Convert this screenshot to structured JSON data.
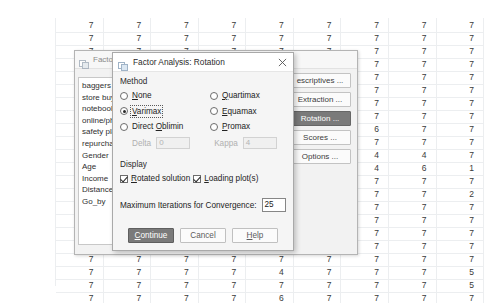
{
  "spreadsheet": {
    "columns": 9,
    "rows": [
      [
        "7",
        "7",
        "7",
        "7",
        "7",
        "7",
        "7",
        "7",
        "7"
      ],
      [
        "7",
        "7",
        "7",
        "7",
        "7",
        "7",
        "7",
        "7",
        "7"
      ],
      [
        "7",
        "7",
        "7",
        "7",
        "7",
        "7",
        "7",
        "7",
        "7"
      ],
      [
        "7",
        "7",
        "7",
        "7",
        "7",
        "7",
        "7",
        "7",
        "7"
      ],
      [
        "7",
        "7",
        "7",
        "7",
        "7",
        "7",
        "7",
        "7",
        "7"
      ],
      [
        "7",
        "7",
        "7",
        "7",
        "7",
        "7",
        "7",
        "7",
        "7"
      ],
      [
        "7",
        "7",
        "7",
        "7",
        "7",
        "7",
        "7",
        "7",
        "7"
      ],
      [
        "7",
        "7",
        "7",
        "7",
        "7",
        "7",
        "7",
        "7",
        "7"
      ],
      [
        "7",
        "7",
        "7",
        "7",
        "7",
        "7",
        "6",
        "7",
        "7"
      ],
      [
        "7",
        "7",
        "7",
        "7",
        "7",
        "7",
        "7",
        "7",
        "7"
      ],
      [
        "7",
        "7",
        "7",
        "7",
        "7",
        "7",
        "4",
        "4",
        "7"
      ],
      [
        "7",
        "7",
        "7",
        "7",
        "7",
        "7",
        "4",
        "6",
        "1"
      ],
      [
        "7",
        "7",
        "7",
        "7",
        "7",
        "7",
        "7",
        "7",
        "7"
      ],
      [
        "7",
        "7",
        "7",
        "7",
        "7",
        "7",
        "7",
        "7",
        "2"
      ],
      [
        "7",
        "7",
        "7",
        "7",
        "7",
        "7",
        "7",
        "7",
        "7"
      ],
      [
        "7",
        "7",
        "7",
        "7",
        "7",
        "7",
        "7",
        "7",
        "7"
      ],
      [
        "7",
        "7",
        "7",
        "7",
        "7",
        "7",
        "7",
        "7",
        "7"
      ],
      [
        "7",
        "7",
        "7",
        "7",
        "7",
        "7",
        "7",
        "7",
        "7"
      ],
      [
        "7",
        "7",
        "7",
        "7",
        "7",
        "7",
        "7",
        "7",
        "7"
      ],
      [
        "7",
        "7",
        "7",
        "7",
        "4",
        "7",
        "7",
        "7",
        "5"
      ],
      [
        "7",
        "7",
        "7",
        "7",
        "7",
        "7",
        "7",
        "7",
        "5"
      ],
      [
        "7",
        "7",
        "7",
        "7",
        "6",
        "7",
        "7",
        "7",
        "7"
      ]
    ]
  },
  "background_dialog": {
    "title": "Factor Analysis",
    "title_clipped": "Factor Anal",
    "icon": "spss-dialog-icon",
    "variables": [
      "baggers [",
      "store buy",
      "notebook",
      "online/ph",
      "safety pla",
      "repurchas",
      "Gender",
      "Age",
      "Income",
      "Distance",
      "Go_by"
    ],
    "side_buttons": [
      {
        "label": "escriptives ...",
        "active": false
      },
      {
        "label": "Extraction ...",
        "active": false
      },
      {
        "label": "Rotation ...",
        "active": true
      },
      {
        "label": "Scores ...",
        "active": false
      },
      {
        "label": "Options ...",
        "active": false
      }
    ],
    "active_button_color": "#7a7a7a"
  },
  "rotation_dialog": {
    "title": "Factor Analysis: Rotation",
    "icon": "spss-dialog-icon",
    "close_icon": "close-icon",
    "method": {
      "group_label": "Method",
      "options": [
        {
          "label": "None",
          "mnemonic": "N",
          "selected": false,
          "focused": false,
          "column": "left"
        },
        {
          "label": "Varimax",
          "mnemonic": "V",
          "selected": true,
          "focused": true,
          "column": "left"
        },
        {
          "label": "Direct Oblimin",
          "mnemonic": "O",
          "selected": false,
          "focused": false,
          "column": "left"
        },
        {
          "label": "Quartimax",
          "mnemonic": "Q",
          "selected": false,
          "focused": false,
          "column": "right"
        },
        {
          "label": "Equamax",
          "mnemonic": "E",
          "selected": false,
          "focused": false,
          "column": "right"
        },
        {
          "label": "Promax",
          "mnemonic": "P",
          "selected": false,
          "focused": false,
          "column": "right"
        }
      ]
    },
    "parameters": [
      {
        "label": "Delta",
        "value": "0",
        "enabled": false
      },
      {
        "label": "Kappa",
        "value": "4",
        "enabled": false
      }
    ],
    "display": {
      "group_label": "Display",
      "checkboxes": [
        {
          "label": "Rotated solution",
          "mnemonic": "R",
          "checked": true
        },
        {
          "label": "Loading plot(s)",
          "mnemonic": "L",
          "checked": true
        }
      ]
    },
    "iterations": {
      "label": "Maximum Iterations for Convergence:",
      "value": "25"
    },
    "footer_buttons": [
      {
        "label": "Continue",
        "mnemonic": "C",
        "primary": true
      },
      {
        "label": "Cancel",
        "mnemonic": "",
        "primary": false
      },
      {
        "label": "Help",
        "mnemonic": "H",
        "primary": false
      }
    ]
  }
}
